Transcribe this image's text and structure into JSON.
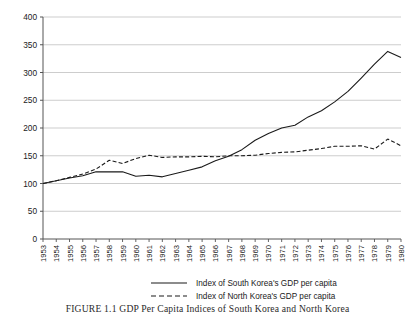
{
  "figure": {
    "caption": "FIGURE 1.1  GDP Per Capita Indices of South Korea and North Korea"
  },
  "chart_data": {
    "type": "line",
    "title": "",
    "xlabel": "",
    "ylabel": "",
    "ylim": [
      0,
      400
    ],
    "ytick_step": 50,
    "yticks": [
      "0",
      "50",
      "100",
      "150",
      "200",
      "250",
      "300",
      "350",
      "400"
    ],
    "grid": true,
    "grid_axis": "y",
    "legend_position": "below",
    "categories": [
      "1953",
      "1954",
      "1955",
      "1956",
      "1957",
      "1958",
      "1959",
      "1960",
      "1961",
      "1962",
      "1963",
      "1964",
      "1965",
      "1966",
      "1967",
      "1968",
      "1969",
      "1970",
      "1971",
      "1972",
      "1973",
      "1974",
      "1975",
      "1976",
      "1977",
      "1978",
      "1979",
      "1980"
    ],
    "series": [
      {
        "name": "Index of South Korea's GDP per capita",
        "style": "solid",
        "color": "#1a1a1a",
        "values": [
          100,
          105,
          110,
          114,
          121,
          121,
          121,
          113,
          115,
          112,
          118,
          124,
          130,
          141,
          149,
          161,
          178,
          190,
          200,
          205,
          220,
          231,
          247,
          266,
          290,
          315,
          338,
          327
        ]
      },
      {
        "name": "Index of North Korea's GDP per capita",
        "style": "dashed",
        "color": "#1a1a1a",
        "values": [
          100,
          105,
          111,
          117,
          126,
          142,
          136,
          145,
          151,
          147,
          148,
          148,
          149,
          148,
          150,
          150,
          151,
          154,
          156,
          157,
          160,
          163,
          167,
          167,
          168,
          162,
          180,
          168
        ]
      }
    ]
  },
  "legend": {
    "items": [
      {
        "label": "Index of South Korea's GDP per capita",
        "style": "solid"
      },
      {
        "label": "Index of North Korea's GDP per capita",
        "style": "dashed"
      }
    ]
  }
}
